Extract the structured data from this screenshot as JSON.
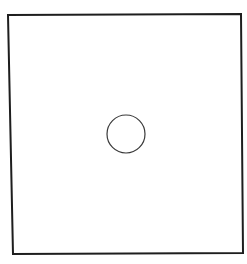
{
  "diagram": {
    "background": "#ffffff",
    "square": {
      "points": [
        [
          8,
          15
        ],
        [
          241,
          14
        ],
        [
          243,
          253
        ],
        [
          13,
          254
        ]
      ],
      "stroke": "#1e1e1e",
      "stroke_width": 2
    },
    "circle": {
      "cx": 126,
      "cy": 134,
      "r": 19,
      "stroke": "#3a3a3a",
      "stroke_width": 1.2
    }
  }
}
